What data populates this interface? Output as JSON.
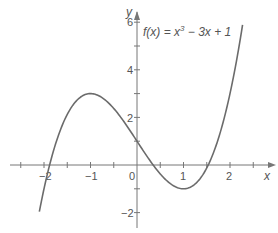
{
  "chart_data": {
    "type": "line",
    "title": "",
    "annotation": "f(x) = x³ − 3x + 1",
    "function": "x^3 - 3x + 1",
    "xlabel": "x",
    "ylabel": "y",
    "xlim": [
      -2.7,
      2.7
    ],
    "ylim": [
      -2.8,
      6.5
    ],
    "x_ticks": [
      -2.5,
      -2,
      -1.5,
      -1,
      -0.5,
      0.5,
      1,
      1.5,
      2,
      2.5
    ],
    "x_tick_labels": [
      "-2",
      "-1",
      "0",
      "1",
      "2"
    ],
    "y_ticks": [
      -2,
      -1,
      1,
      2,
      3,
      4,
      5,
      6
    ],
    "y_tick_labels": [
      "-2",
      "2",
      "4",
      "6"
    ],
    "grid": false,
    "series": [
      {
        "name": "f(x) = x³ − 3x + 1",
        "x": [
          -2.1,
          -2.0,
          -1.88,
          -1.5,
          -1.0,
          -0.5,
          0.0,
          0.35,
          0.5,
          1.0,
          1.5,
          1.53,
          2.0,
          2.27
        ],
        "y": [
          -1.96,
          -1.0,
          0.0,
          2.13,
          3.0,
          2.38,
          1.0,
          0.0,
          -0.38,
          -1.0,
          0.88,
          0.0,
          3.0,
          5.89
        ]
      }
    ],
    "key_points": {
      "local_max": [
        -1,
        3
      ],
      "local_min": [
        1,
        -1
      ],
      "y_intercept": [
        0,
        1
      ],
      "roots": [
        -1.88,
        0.35,
        1.53
      ]
    }
  },
  "labels": {
    "x_axis": "x",
    "y_axis": "y",
    "annotation_prefix": "f(x) = x",
    "annotation_exp": "3",
    "annotation_suffix": " − 3x + 1",
    "tick_x_neg2": "−2",
    "tick_x_neg1": "−1",
    "tick_origin": "0",
    "tick_x_1": "1",
    "tick_x_2": "2",
    "tick_y_6": "6",
    "tick_y_4": "4",
    "tick_y_2": "2",
    "tick_y_neg2": "−2"
  }
}
